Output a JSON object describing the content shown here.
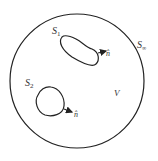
{
  "diagram": {
    "outer_surface": {
      "label": "S",
      "subscript": "∞"
    },
    "volume": {
      "label": "V"
    },
    "surfaces": [
      {
        "label": "S",
        "subscript": "1",
        "normal_label": "n̂"
      },
      {
        "label": "S",
        "subscript": "2",
        "normal_label": "n̂"
      }
    ],
    "colors": {
      "stroke": "#222222",
      "background": "#ffffff"
    }
  }
}
